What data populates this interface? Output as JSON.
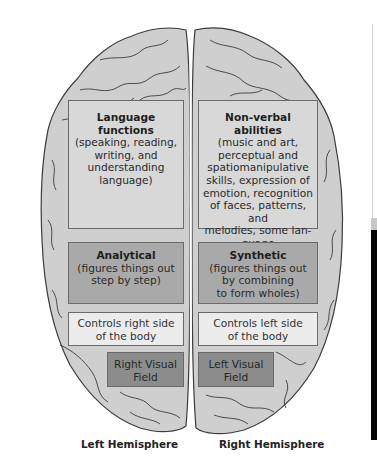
{
  "diagram": {
    "type": "brain-hemisphere-functions",
    "colors": {
      "brain_fill": "#cfcfcf",
      "brain_outline": "#3c3c3c",
      "box_light": "#d8d8d8",
      "box_mid": "#a9a9a9",
      "box_pale": "#ececec",
      "box_dark": "#8c8c8c"
    },
    "left_hemisphere": {
      "label": "Left Hemisphere",
      "boxes": [
        {
          "title": "Language functions",
          "title_lines": [
            "Language",
            "functions"
          ],
          "body_lines": [
            "(speaking, reading,",
            "writing, and",
            "understanding",
            "language)"
          ]
        },
        {
          "title": "Analytical",
          "title_lines": [
            "Analytical"
          ],
          "body_lines": [
            "(figures things out",
            "step by step)"
          ]
        },
        {
          "title": "",
          "body_lines": [
            "Controls right side",
            "of the body"
          ]
        },
        {
          "title": "",
          "body_lines": [
            "Right Visual",
            "Field"
          ]
        }
      ]
    },
    "right_hemisphere": {
      "label": "Right Hemisphere",
      "boxes": [
        {
          "title": "Non-verbal abilities",
          "title_lines": [
            "Non-verbal",
            "abilities"
          ],
          "body_lines": [
            "(music and art,",
            "perceptual and",
            "spatiomanipulative",
            "skills, expression of",
            "emotion, recognition",
            "of faces, patterns, and",
            "melodies, some lan-",
            "guage comprehension)"
          ]
        },
        {
          "title": "Synthetic",
          "title_lines": [
            "Synthetic"
          ],
          "body_lines": [
            "(figures things out",
            "by combining",
            "to form wholes)"
          ]
        },
        {
          "title": "",
          "body_lines": [
            "Controls left side",
            "of the body"
          ]
        },
        {
          "title": "",
          "body_lines": [
            "Left Visual",
            "Field"
          ]
        }
      ]
    }
  }
}
